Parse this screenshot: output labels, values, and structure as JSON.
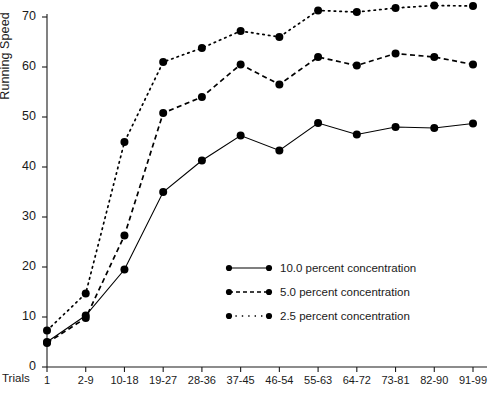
{
  "chart_data": {
    "type": "line",
    "title": "",
    "xlabel": "Trials",
    "ylabel": "Running Speed",
    "ylim": [
      0,
      72
    ],
    "yticks": [
      0,
      10,
      20,
      30,
      40,
      50,
      60,
      70
    ],
    "grid": false,
    "legend_position": "center-right",
    "categories": [
      "1",
      "2-9",
      "10-18",
      "19-27",
      "28-36",
      "37-45",
      "46-54",
      "55-63",
      "64-72",
      "73-81",
      "82-90",
      "91-99"
    ],
    "series": [
      {
        "name": "10.0 percent concentration",
        "style": "solid",
        "color": "#000000",
        "values": [
          5.0,
          10.3,
          19.5,
          35.0,
          41.3,
          46.3,
          43.3,
          48.8,
          46.5,
          48.0,
          47.8,
          48.7
        ]
      },
      {
        "name": "5.0 percent concentration",
        "style": "dashed",
        "color": "#000000",
        "values": [
          4.8,
          9.8,
          26.3,
          50.8,
          54.0,
          60.5,
          56.5,
          62.0,
          60.3,
          62.7,
          62.0,
          60.5
        ]
      },
      {
        "name": "2.5 percent concentration",
        "style": "dotted",
        "color": "#000000",
        "values": [
          7.3,
          14.7,
          45.0,
          61.0,
          63.8,
          67.2,
          66.0,
          71.3,
          71.0,
          71.8,
          72.3,
          72.2
        ]
      }
    ]
  },
  "legend": {
    "items": [
      {
        "label": "10.0 percent concentration"
      },
      {
        "label": "5.0 percent concentration"
      },
      {
        "label": "2.5 percent concentration"
      }
    ]
  },
  "axes": {
    "y_title": "Running Speed",
    "x_title": "Trials"
  }
}
